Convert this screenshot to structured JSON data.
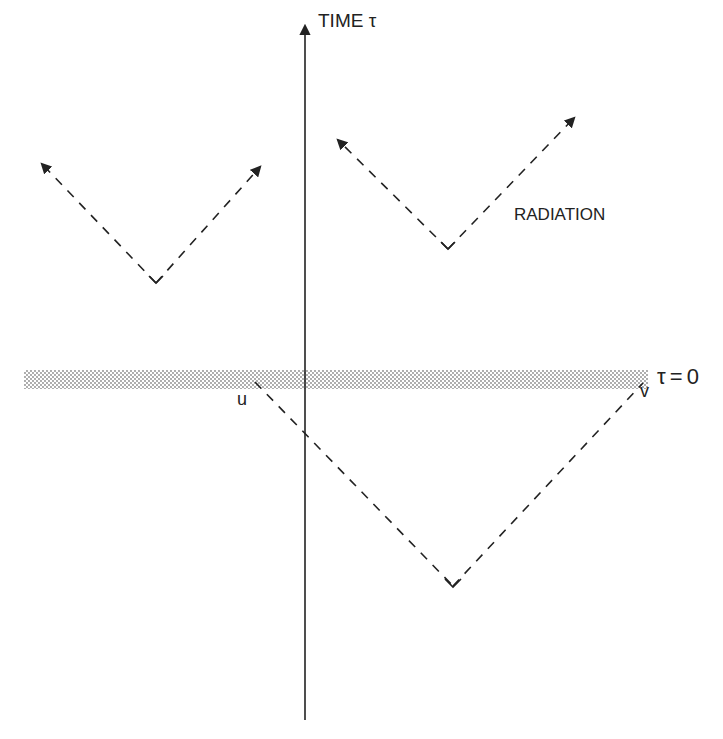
{
  "axis": {
    "label": "TIME τ",
    "x": 305,
    "y_top": 20,
    "y_bottom": 720
  },
  "surface": {
    "label": "τ = 0",
    "y": 380,
    "x_start": 24,
    "x_end": 648,
    "pattern": "stippled"
  },
  "annotations": {
    "radiation": "RADIATION",
    "point_u": "u",
    "point_v": "v"
  },
  "light_cones": [
    {
      "name": "left-upper-cone",
      "vertex": [
        156,
        283
      ],
      "left_tip": [
        40,
        162
      ],
      "right_tip": [
        262,
        165
      ]
    },
    {
      "name": "right-upper-cone",
      "vertex": [
        448,
        249
      ],
      "left_tip": [
        336,
        138
      ],
      "right_tip": [
        576,
        116
      ]
    },
    {
      "name": "lower-cone",
      "vertex": [
        453,
        586
      ],
      "left_end": [
        255,
        382
      ],
      "right_end": [
        643,
        383
      ]
    }
  ],
  "colors": {
    "ink": "#222222",
    "stipple": "#9a9a9a"
  }
}
